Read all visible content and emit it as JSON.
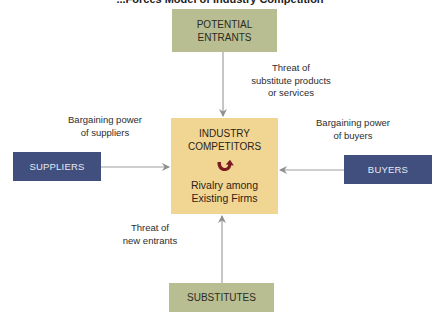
{
  "diagram": {
    "title_visible_fragment": "...Forces Model of Industry Competition",
    "nodes": {
      "potential_entrants": {
        "label_line1": "POTENTIAL",
        "label_line2": "ENTRANTS",
        "color": "#b8bd92"
      },
      "suppliers": {
        "label": "SUPPLIERS",
        "color": "#404f7e"
      },
      "buyers": {
        "label": "BUYERS",
        "color": "#404f7e"
      },
      "substitutes": {
        "label": "SUBSTITUTES",
        "color": "#b8bd92"
      },
      "industry_competitors": {
        "label_line1": "INDUSTRY",
        "label_line2": "COMPETITORS",
        "icon": "rivalry-circular-arrow-icon",
        "sub_line1": "Rivalry among",
        "sub_line2": "Existing Firms",
        "color": "#f1d592",
        "icon_color": "#7a1a22"
      }
    },
    "edge_labels": {
      "top": {
        "line1": "Threat of",
        "line2": "substitute products",
        "line3": "or services"
      },
      "left": {
        "line1": "Bargaining power",
        "line2": "of suppliers"
      },
      "right": {
        "line1": "Bargaining power",
        "line2": "of buyers"
      },
      "bottom": {
        "line1": "Threat of",
        "line2": "new entrants"
      }
    },
    "edges": [
      {
        "from": "potential_entrants",
        "to": "industry_competitors"
      },
      {
        "from": "suppliers",
        "to": "industry_competitors"
      },
      {
        "from": "buyers",
        "to": "industry_competitors"
      },
      {
        "from": "substitutes",
        "to": "industry_competitors"
      }
    ],
    "arrow_color": "#9a9a9a"
  }
}
